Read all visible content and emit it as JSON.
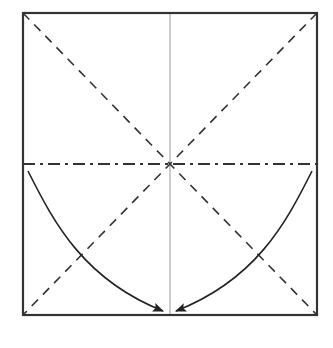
{
  "diagram": {
    "type": "origami-fold-diagram",
    "colors": {
      "background": "#ffffff",
      "line": "#222222",
      "crease": "#888888"
    },
    "square": {
      "x1": 23,
      "y1": 13,
      "x2": 317,
      "y2": 315
    },
    "center": {
      "x": 170,
      "y": 164
    },
    "lines": [
      {
        "kind": "valley-fold-diagonal",
        "from": [
          23,
          13
        ],
        "to": [
          317,
          315
        ]
      },
      {
        "kind": "valley-fold-diagonal",
        "from": [
          317,
          13
        ],
        "to": [
          23,
          315
        ]
      },
      {
        "kind": "crease-vertical",
        "from": [
          170,
          13
        ],
        "to": [
          170,
          315
        ]
      },
      {
        "kind": "mountain-fold-horizontal",
        "from": [
          23,
          164
        ],
        "to": [
          317,
          164
        ]
      }
    ],
    "arrows": [
      {
        "name": "left-arrow",
        "from": [
          28,
          171
        ],
        "to": [
          164,
          312
        ]
      },
      {
        "name": "right-arrow",
        "from": [
          312,
          171
        ],
        "to": [
          175,
          312
        ]
      }
    ]
  }
}
